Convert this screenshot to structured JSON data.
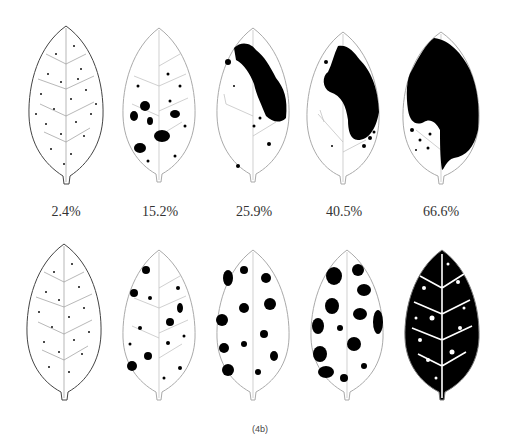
{
  "figure": {
    "caption": "(4b)",
    "severity_labels": [
      "2.4%",
      "15.2%",
      "25.9%",
      "40.5%",
      "66.6%"
    ],
    "rows": [
      {
        "name": "top-row",
        "pattern": "clustered lesions",
        "leaves": [
          {
            "severity": "2.4%",
            "pattern": "scattered dots"
          },
          {
            "severity": "15.2%",
            "pattern": "scattered blotches"
          },
          {
            "severity": "25.9%",
            "pattern": "diagonal band"
          },
          {
            "severity": "40.5%",
            "pattern": "right-half mass"
          },
          {
            "severity": "66.6%",
            "pattern": "large mass"
          }
        ]
      },
      {
        "name": "bottom-row",
        "pattern": "dispersed lesions",
        "leaves": [
          {
            "severity": "2.4%",
            "pattern": "scattered dots"
          },
          {
            "severity": "15.2%",
            "pattern": "small spots"
          },
          {
            "severity": "25.9%",
            "pattern": "medium spots"
          },
          {
            "severity": "40.5%",
            "pattern": "large spots"
          },
          {
            "severity": "66.6%",
            "pattern": "near-complete coverage"
          }
        ]
      }
    ],
    "colors": {
      "lesion": "#000000",
      "outline": "#555555",
      "background": "#ffffff"
    }
  }
}
